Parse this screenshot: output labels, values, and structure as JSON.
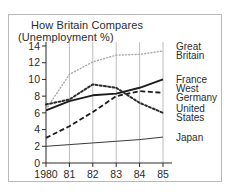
{
  "chart_data": {
    "type": "line",
    "title": "How Britain Compares",
    "subtitle": "(Unemployment %)",
    "xlabel": "",
    "ylabel": "",
    "x": [
      1980,
      1981,
      1982,
      1983,
      1984,
      1985
    ],
    "xtick_labels": [
      "1980",
      "81",
      "82",
      "83",
      "84",
      "85"
    ],
    "ytick_labels": [
      "0",
      "2",
      "4",
      "6",
      "8",
      "10",
      "12",
      "14"
    ],
    "ytick_values": [
      0,
      2,
      4,
      6,
      8,
      10,
      12,
      14
    ],
    "xlim": [
      1980,
      1985
    ],
    "ylim": [
      0,
      14
    ],
    "grid": "vertical",
    "legend_position": "right",
    "series": [
      {
        "name": "Great Britain",
        "label_lines": [
          "Great",
          "Britain"
        ],
        "style": "fine-dotted",
        "color": "#a8a8a8",
        "values": [
          6.4,
          10.6,
          12.1,
          12.9,
          13.0,
          13.4
        ]
      },
      {
        "name": "France",
        "label_lines": [
          "France"
        ],
        "style": "solid-thick",
        "color": "#1c1c1c",
        "values": [
          6.3,
          7.4,
          8.1,
          8.3,
          9.0,
          10.0
        ]
      },
      {
        "name": "West Germany",
        "label_lines": [
          "West",
          "Germany"
        ],
        "style": "dashed",
        "color": "#1c1c1c",
        "values": [
          3.0,
          4.4,
          6.1,
          8.0,
          8.6,
          8.4
        ]
      },
      {
        "name": "United States",
        "label_lines": [
          "United",
          "States"
        ],
        "style": "coarse-dotted",
        "color": "#2b2b2b",
        "values": [
          7.0,
          7.6,
          9.4,
          9.0,
          7.2,
          6.0
        ]
      },
      {
        "name": "Japan",
        "label_lines": [
          "Japan"
        ],
        "style": "solid-thin",
        "color": "#3a3a3a",
        "values": [
          2.0,
          2.2,
          2.4,
          2.6,
          2.8,
          3.1
        ]
      }
    ]
  }
}
